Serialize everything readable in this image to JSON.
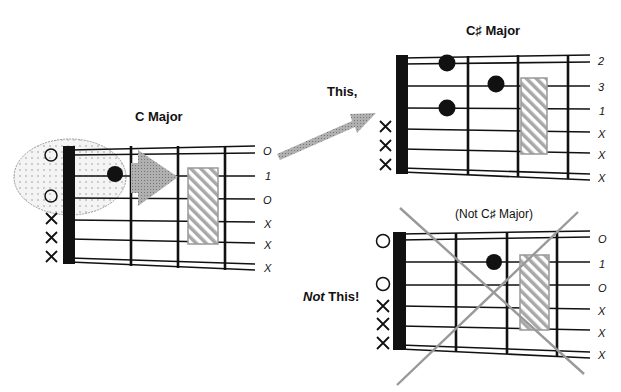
{
  "figure": {
    "left": {
      "title": "C  Major",
      "string_labels": [
        "O",
        "1",
        "O",
        "X",
        "X",
        "X"
      ],
      "open_markers": [
        "O",
        "O"
      ],
      "mute_markers": [
        "X",
        "X",
        "X"
      ]
    },
    "top_right": {
      "title": "C♯  Major",
      "caption": "This,",
      "string_labels": [
        "2",
        "3",
        "1",
        "X",
        "X",
        "X"
      ],
      "mute_markers": [
        "X",
        "X",
        "X"
      ]
    },
    "bottom_right": {
      "title": "(Not C♯ Major)",
      "caption_bold_italic": "Not",
      "caption_rest": " This!",
      "string_labels": [
        "O",
        "1",
        "O",
        "X",
        "X",
        "X"
      ],
      "open_markers": [
        "O",
        "O"
      ],
      "mute_markers": [
        "X",
        "X",
        "X"
      ]
    },
    "colors": {
      "ink": "#111111",
      "arrow_gray": "#9a9a9a",
      "hatch_gray": "#a8a8a8",
      "cross_gray": "#999999",
      "ellipse_fill": "#eeeeee"
    }
  }
}
